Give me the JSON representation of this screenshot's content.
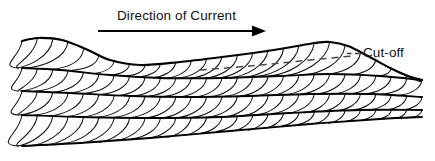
{
  "figure": {
    "name": "cross-bedding-cut-off-diagram",
    "background_color": "#ffffff",
    "line_color": "#000000",
    "lamina_color": "#111111",
    "cutoff_color": "#4a4a4a",
    "width": 435,
    "height": 161
  },
  "annotations": {
    "current_label": "Direction of Current",
    "cutoff_label": "Cut-off"
  },
  "icons": {
    "current_arrow": "right-arrow-icon",
    "cutoff_dashes": "dashed-leader-icon"
  },
  "chart_data": {
    "type": "line",
    "title": "Direction of Current",
    "subtitle": "",
    "xlabel": "",
    "ylabel": "",
    "grid": false,
    "legend": "none",
    "xlim": [
      0,
      435
    ],
    "ylim": [
      161,
      0
    ],
    "annotations": [
      {
        "text": "Direction of Current",
        "x": 184,
        "y": 15
      },
      {
        "text": "Cut-off",
        "x": 385,
        "y": 52
      }
    ],
    "series": [
      {
        "name": "current-arrow-shaft",
        "kind": "arrow",
        "points": [
          [
            98,
            31
          ],
          [
            258,
            31
          ]
        ]
      },
      {
        "name": "top-surface",
        "kind": "bedform-crest",
        "points": [
          [
            22,
            41
          ],
          [
            38,
            38
          ],
          [
            62,
            40
          ],
          [
            88,
            50
          ],
          [
            110,
            60
          ],
          [
            140,
            65
          ],
          [
            180,
            62
          ],
          [
            230,
            56
          ],
          [
            280,
            49
          ],
          [
            315,
            43
          ],
          [
            330,
            42
          ],
          [
            348,
            46
          ],
          [
            368,
            56
          ],
          [
            390,
            68
          ],
          [
            408,
            76
          ],
          [
            422,
            80
          ]
        ]
      },
      {
        "name": "bounding-surface-1",
        "kind": "set-boundary",
        "points": [
          [
            22,
            68
          ],
          [
            60,
            70
          ],
          [
            110,
            75
          ],
          [
            160,
            78
          ],
          [
            220,
            78
          ],
          [
            280,
            76
          ],
          [
            330,
            74
          ],
          [
            380,
            76
          ],
          [
            422,
            80
          ]
        ]
      },
      {
        "name": "bounding-surface-2",
        "kind": "set-boundary",
        "points": [
          [
            22,
            91
          ],
          [
            70,
            93
          ],
          [
            130,
            96
          ],
          [
            190,
            97
          ],
          [
            250,
            96
          ],
          [
            310,
            94
          ],
          [
            370,
            94
          ],
          [
            422,
            97
          ]
        ]
      },
      {
        "name": "bounding-surface-3",
        "kind": "set-boundary",
        "points": [
          [
            22,
            115
          ],
          [
            80,
            117
          ],
          [
            150,
            118
          ],
          [
            220,
            117
          ],
          [
            290,
            113
          ],
          [
            360,
            110
          ],
          [
            422,
            110
          ]
        ]
      },
      {
        "name": "basal-surface",
        "kind": "set-boundary",
        "points": [
          [
            22,
            146
          ],
          [
            80,
            143
          ],
          [
            150,
            138
          ],
          [
            230,
            131
          ],
          [
            310,
            124
          ],
          [
            380,
            119
          ],
          [
            422,
            117
          ]
        ]
      },
      {
        "name": "cut-off-surface",
        "kind": "dashed-truncation",
        "points": [
          [
            200,
            70
          ],
          [
            250,
            66
          ],
          [
            300,
            61
          ],
          [
            352,
            56
          ]
        ]
      }
    ],
    "lamina_sets": [
      {
        "name": "set-1",
        "count": 26,
        "description": "upper climbing-ripple laminae, concave toward current"
      },
      {
        "name": "set-2",
        "count": 26,
        "description": "second set laminae"
      },
      {
        "name": "set-3",
        "count": 26,
        "description": "third set laminae"
      },
      {
        "name": "set-4",
        "count": 26,
        "description": "basal set laminae"
      }
    ]
  }
}
